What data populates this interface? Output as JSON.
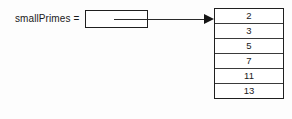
{
  "diagram": {
    "kind": "pointer-to-array-diagram",
    "variable": {
      "label": "smallPrimes =",
      "box_value": ""
    },
    "arrow": {
      "direction": "right",
      "head_style": "solid-triangle"
    },
    "array": {
      "name": "smallPrimes",
      "cells": [
        {
          "value": "2"
        },
        {
          "value": "3"
        },
        {
          "value": "5"
        },
        {
          "value": "7"
        },
        {
          "value": "11"
        },
        {
          "value": "13"
        }
      ]
    },
    "colors": {
      "background": "#fdfdfd",
      "stroke": "#1f1f1f",
      "cell_divider": "#3a3a3a",
      "text": "#1a1a1a",
      "cell_fill": "#ffffff"
    }
  }
}
